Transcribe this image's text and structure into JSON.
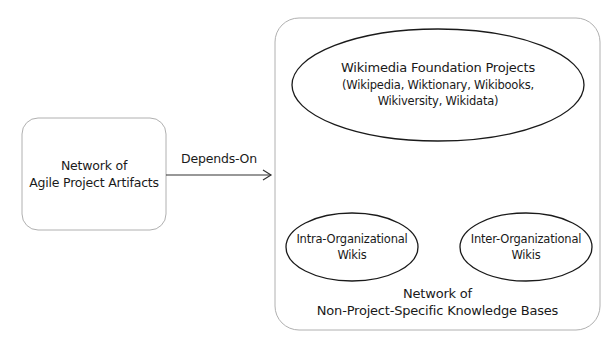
{
  "diagram": {
    "left_box": {
      "line1": "Network of",
      "line2": "Agile Project Artifacts"
    },
    "edge": {
      "label": "Depends-On",
      "direction": "left-to-right"
    },
    "right_box": {
      "line1": "Network of",
      "line2": "Non-Project-Specific Knowledge Bases",
      "children": {
        "wikimedia": {
          "title": "Wikimedia Foundation Projects",
          "line2": "(Wikipedia, Wiktionary, Wikibooks,",
          "line3": "Wikiversity, Wikidata)"
        },
        "intra": {
          "line1": "Intra-Organizational",
          "line2": "Wikis"
        },
        "inter": {
          "line1": "Inter-Organizational",
          "line2": "Wikis"
        }
      }
    }
  },
  "colors": {
    "box_border": "#b0b0b0",
    "ellipse_border": "#1a1a1a",
    "arrow": "#333333",
    "text": "#1a1a1a"
  }
}
